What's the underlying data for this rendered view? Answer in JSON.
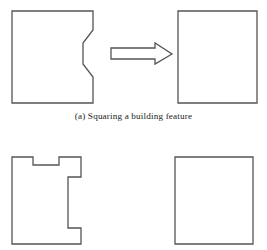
{
  "figure": {
    "width": 267,
    "height": 250,
    "background_color": "#ffffff",
    "stroke_color": "#555555",
    "fill_color": "#ffffff",
    "stroke_width": 1.3
  },
  "panels": [
    {
      "id": "a",
      "caption": "(a) Squaring a building feature",
      "shapes": [
        {
          "name": "input-polygon-notched-building",
          "role": "before",
          "description": "Rectangle with a zigzag indentation along its right edge",
          "points": "12,11 93,11 93,30 83,43 83,64 93,77 93,103 12,103"
        },
        {
          "name": "transform-arrow",
          "role": "operator",
          "description": "Hollow outlined right-pointing arrow",
          "points": "111,48 155,48 155,43 172,54 155,64 155,59 111,59"
        },
        {
          "name": "output-rectangle-squared-building",
          "role": "after",
          "description": "Plain squared rectangle",
          "points": "178,11 257,11 257,103 178,103"
        }
      ]
    },
    {
      "id": "b",
      "caption": "",
      "shapes": [
        {
          "name": "input-polygon-notched-building",
          "role": "before",
          "description": "Rectangle with a rectangular notch in the top edge and a stepped indentation on the right edge",
          "points": "12,157 33,157 33,165 59,165 59,157 81,157 81,177 68,177 68,228 81,228 81,244 12,244"
        },
        {
          "name": "output-rectangle-squared-building",
          "role": "after",
          "description": "Plain squared rectangle",
          "points": "175,157 253,157 253,244 175,244"
        }
      ]
    }
  ]
}
